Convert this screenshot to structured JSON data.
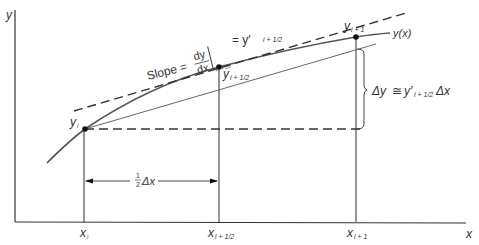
{
  "axes": {
    "y_label": "y",
    "x_label": "x"
  },
  "x_ticks": [
    {
      "base": "x",
      "sub": "i"
    },
    {
      "base": "x",
      "sub": "i + 1/2"
    },
    {
      "base": "x",
      "sub": "i + 1"
    }
  ],
  "points": [
    {
      "base": "y",
      "sub": "i"
    },
    {
      "base": "y",
      "sub": "i + 1/2"
    },
    {
      "base": "y",
      "sub": "i + 1"
    }
  ],
  "curve_label": "y(x)",
  "slope_label": {
    "prefix": "Slope =",
    "num": "dy",
    "den": "dx",
    "eval_sub": "x i + 1/2",
    "rhs": "= y′",
    "rhs_sub": "i + 1/2"
  },
  "delta_y_label": {
    "lhs": "Δy",
    "op": "≅",
    "rhs": "y′",
    "rhs_sub": "i + 1/2",
    "tail": "Δx"
  },
  "half_dx_label": {
    "frac_num": "1",
    "frac_den": "2",
    "text": "Δx"
  },
  "colors": {
    "line": "#333333",
    "curve": "#555555",
    "text": "#333333"
  }
}
